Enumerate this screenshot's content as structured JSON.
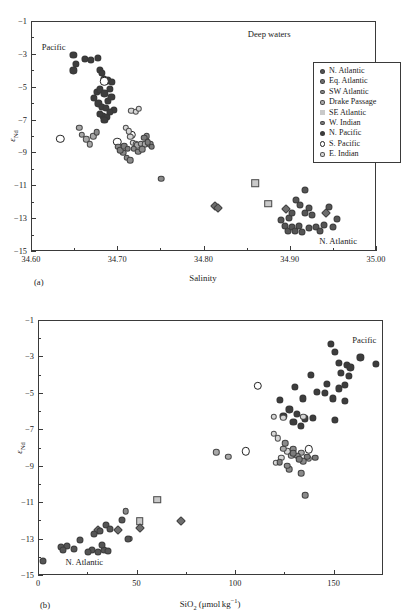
{
  "figure": {
    "suptitle": "",
    "panel_a_label": "(a)",
    "panel_b_label": "(b)"
  },
  "legend": {
    "entries": [
      {
        "label": "N. Atlantic",
        "marker": "circle",
        "color": "#555555",
        "size": 5.2
      },
      {
        "label": "Eq. Atlantic",
        "marker": "circle",
        "color": "#6e6e6e",
        "size": 4.6
      },
      {
        "label": "SW Atlantic",
        "marker": "circle",
        "color": "#8a8a8a",
        "size": 4.6
      },
      {
        "label": "Drake Passage",
        "marker": "circle",
        "color": "#a8a8a8",
        "size": 4.4
      },
      {
        "label": "SE Atlantic",
        "marker": "square",
        "color": "#c9c9c9",
        "size": 5.0
      },
      {
        "label": "W. Indian",
        "marker": "circle",
        "color": "#7c7c7c",
        "size": 4.6
      },
      {
        "label": "N. Pacific",
        "marker": "circle",
        "color": "#3d3d3d",
        "size": 5.4
      },
      {
        "label": "S. Pacific",
        "marker": "open",
        "color": "#ffffff",
        "size": 5.6
      },
      {
        "label": "E. Indian",
        "marker": "circle",
        "color": "#d6d6d6",
        "size": 4.6
      }
    ]
  },
  "chart_data": [
    {
      "panel": "a",
      "type": "scatter",
      "title": "Deep waters",
      "xlabel": "Salinity",
      "ylabel": "eNd",
      "xlim": [
        34.6,
        35.0
      ],
      "ylim": [
        -15,
        -1
      ],
      "xticks": [
        34.6,
        34.7,
        34.8,
        34.9,
        35.0
      ],
      "xticklabels": [
        "34.60",
        "34.70",
        "34.80",
        "34.90",
        "35.00"
      ],
      "yticks": [
        -1,
        -3,
        -5,
        -7,
        -9,
        -11,
        -13,
        -15
      ],
      "yticklabels": [
        "-1",
        "-3",
        "-5",
        "-7",
        "-9",
        "-11",
        "-13",
        "-15"
      ],
      "xminor": [
        34.65,
        34.75,
        34.85,
        34.95
      ],
      "yminor": [
        -2,
        -4,
        -6,
        -8,
        -10,
        -12,
        -14
      ],
      "grid": false,
      "annotations": [
        {
          "text": "Pacific",
          "x": 34.625,
          "y": -2.55
        },
        {
          "text": "Deep waters",
          "x": 34.875,
          "y": -1.7
        },
        {
          "text": "N. Atlantic",
          "x": 34.955,
          "y": -14.35
        }
      ],
      "series": [
        {
          "name": "N. Pacific",
          "marker": "circle",
          "color": "#3d3d3d",
          "size": 7.2,
          "points": [
            [
              34.648,
              -3.0
            ],
            [
              34.651,
              -3.55
            ],
            [
              34.661,
              -3.25
            ],
            [
              34.668,
              -3.3
            ],
            [
              34.676,
              -3.2
            ],
            [
              34.648,
              -3.95
            ],
            [
              34.679,
              -3.9
            ],
            [
              34.681,
              -4.1
            ],
            [
              34.683,
              -4.45
            ],
            [
              34.688,
              -4.55
            ],
            [
              34.693,
              -4.65
            ],
            [
              34.675,
              -5.25
            ],
            [
              34.679,
              -5.1
            ],
            [
              34.684,
              -5.35
            ],
            [
              34.69,
              -5.05
            ],
            [
              34.695,
              -6.35
            ],
            [
              34.677,
              -5.95
            ],
            [
              34.681,
              -6.15
            ],
            [
              34.686,
              -6.25
            ],
            [
              34.69,
              -6.45
            ],
            [
              34.682,
              -6.7
            ],
            [
              34.687,
              -6.8
            ],
            [
              34.679,
              -6.6
            ],
            [
              34.684,
              -6.95
            ],
            [
              34.672,
              -5.6
            ],
            [
              34.688,
              -5.8
            ],
            [
              34.692,
              -5.55
            ]
          ]
        },
        {
          "name": "S. Pacific",
          "marker": "open",
          "color": "#ffffff",
          "size": 8.4,
          "points": [
            [
              34.633,
              -8.1
            ],
            [
              34.699,
              -8.3
            ],
            [
              34.716,
              -7.85
            ],
            [
              34.684,
              -4.6
            ]
          ]
        },
        {
          "name": "E. Indian",
          "marker": "circle",
          "color": "#d6d6d6",
          "size": 6.4,
          "points": [
            [
              34.715,
              -6.4
            ],
            [
              34.72,
              -6.45
            ],
            [
              34.724,
              -6.3
            ],
            [
              34.709,
              -7.45
            ],
            [
              34.712,
              -7.65
            ],
            [
              34.714,
              -8.0
            ],
            [
              34.717,
              -8.35
            ],
            [
              34.72,
              -8.45
            ]
          ]
        },
        {
          "name": "Drake Passage",
          "marker": "circle",
          "color": "#a8a8a8",
          "size": 6.4,
          "points": [
            [
              34.655,
              -7.45
            ],
            [
              34.658,
              -7.85
            ],
            [
              34.663,
              -8.15
            ],
            [
              34.667,
              -8.45
            ],
            [
              34.671,
              -7.95
            ],
            [
              34.722,
              -8.5
            ],
            [
              34.726,
              -8.4
            ],
            [
              34.731,
              -8.45
            ]
          ]
        },
        {
          "name": "SW Atlantic",
          "marker": "circle",
          "color": "#8a8a8a",
          "size": 6.6,
          "points": [
            [
              34.675,
              -7.7
            ],
            [
              34.7,
              -8.6
            ],
            [
              34.706,
              -8.95
            ],
            [
              34.71,
              -9.25
            ],
            [
              34.714,
              -9.4
            ],
            [
              34.718,
              -8.7
            ],
            [
              34.723,
              -8.9
            ],
            [
              34.728,
              -8.75
            ],
            [
              34.733,
              -7.95
            ],
            [
              34.737,
              -8.45
            ],
            [
              34.75,
              -10.55
            ]
          ]
        },
        {
          "name": "W. Indian",
          "marker": "circle",
          "color": "#7c7c7c",
          "size": 6.6,
          "points": [
            [
              34.702,
              -8.8
            ],
            [
              34.707,
              -8.55
            ],
            [
              34.711,
              -8.7
            ],
            [
              34.73,
              -8.05
            ],
            [
              34.734,
              -8.3
            ],
            [
              34.739,
              -8.6
            ]
          ]
        },
        {
          "name": "SE Atlantic",
          "marker": "square",
          "color": "#c9c9c9",
          "size": 7.6,
          "points": [
            [
              34.859,
              -10.8
            ],
            [
              34.874,
              -12.05
            ]
          ]
        },
        {
          "name": "Eq. Atlantic",
          "marker": "diamond",
          "color": "#6e6e6e",
          "size": 7.0,
          "points": [
            [
              34.812,
              -12.2
            ],
            [
              34.816,
              -12.35
            ],
            [
              34.894,
              -12.4
            ],
            [
              34.941,
              -12.65
            ]
          ]
        },
        {
          "name": "N. Atlantic",
          "marker": "circle",
          "color": "#555555",
          "size": 7.0,
          "points": [
            [
              34.889,
              -13.05
            ],
            [
              34.893,
              -13.4
            ],
            [
              34.897,
              -13.7
            ],
            [
              34.901,
              -13.45
            ],
            [
              34.905,
              -13.75
            ],
            [
              34.909,
              -13.4
            ],
            [
              34.913,
              -13.8
            ],
            [
              34.898,
              -12.95
            ],
            [
              34.902,
              -12.65
            ],
            [
              34.906,
              -11.85
            ],
            [
              34.911,
              -12.15
            ],
            [
              34.917,
              -12.6
            ],
            [
              34.921,
              -13.55
            ],
            [
              34.925,
              -12.75
            ],
            [
              34.929,
              -13.45
            ],
            [
              34.934,
              -13.7
            ],
            [
              34.938,
              -13.35
            ],
            [
              34.944,
              -12.25
            ],
            [
              34.949,
              -13.45
            ],
            [
              34.954,
              -13.0
            ],
            [
              34.917,
              -11.25
            ],
            [
              34.921,
              -12.35
            ]
          ]
        }
      ]
    },
    {
      "panel": "b",
      "type": "scatter",
      "title": "",
      "xlabel": "SiO2 (umol kg-1)",
      "ylabel": "eNd",
      "xlim": [
        0,
        175
      ],
      "ylim": [
        -15,
        -1
      ],
      "xticks": [
        0,
        50,
        100,
        150
      ],
      "xticklabels": [
        "0",
        "50",
        "100",
        "150"
      ],
      "yticks": [
        -1,
        -3,
        -5,
        -7,
        -9,
        -11,
        -13,
        -15
      ],
      "yticklabels": [
        "-1",
        "-3",
        "-5",
        "-7",
        "-9",
        "-11",
        "-13",
        "-15"
      ],
      "xminor": [
        25,
        75,
        125
      ],
      "yminor": [
        -2,
        -4,
        -6,
        -8,
        -10,
        -12,
        -14
      ],
      "grid": false,
      "annotations": [
        {
          "text": "Pacific",
          "x": 165,
          "y": -2.05
        },
        {
          "text": "N. Atlantic",
          "x": 23,
          "y": -14.25
        }
      ],
      "series": [
        {
          "name": "N. Pacific",
          "marker": "circle",
          "color": "#3d3d3d",
          "size": 7.2,
          "points": [
            [
              148,
              -2.25
            ],
            [
              150,
              -2.7
            ],
            [
              163,
              -3.0
            ],
            [
              171,
              -3.35
            ],
            [
              152,
              -3.3
            ],
            [
              156,
              -3.4
            ],
            [
              158,
              -3.55
            ],
            [
              153,
              -3.85
            ],
            [
              157,
              -4.0
            ],
            [
              138,
              -3.95
            ],
            [
              146,
              -4.45
            ],
            [
              152,
              -4.7
            ],
            [
              155,
              -4.5
            ],
            [
              130,
              -4.6
            ],
            [
              141,
              -4.9
            ],
            [
              145,
              -4.95
            ],
            [
              149,
              -5.25
            ],
            [
              155,
              -5.4
            ],
            [
              122,
              -5.35
            ],
            [
              134,
              -5.25
            ],
            [
              150,
              -6.45
            ],
            [
              127,
              -5.85
            ],
            [
              131,
              -6.1
            ],
            [
              135,
              -6.35
            ],
            [
              129,
              -6.55
            ],
            [
              133,
              -6.75
            ],
            [
              124,
              -6.2
            ],
            [
              139,
              -6.3
            ]
          ]
        },
        {
          "name": "S. Pacific",
          "marker": "open",
          "color": "#ffffff",
          "size": 8.4,
          "points": [
            [
              111,
              -4.55
            ],
            [
              105,
              -8.15
            ],
            [
              137,
              -8.05
            ]
          ]
        },
        {
          "name": "E. Indian",
          "marker": "circle",
          "color": "#d6d6d6",
          "size": 6.4,
          "points": [
            [
              119,
              -6.25
            ],
            [
              124,
              -6.3
            ],
            [
              134,
              -6.25
            ],
            [
              119,
              -7.2
            ],
            [
              121,
              -7.45
            ],
            [
              120,
              -8.8
            ],
            [
              123,
              -8.5
            ],
            [
              126,
              -8.15
            ]
          ]
        },
        {
          "name": "Drake Passage",
          "marker": "circle",
          "color": "#a8a8a8",
          "size": 6.4,
          "points": [
            [
              90,
              -8.2
            ],
            [
              96,
              -8.45
            ],
            [
              128,
              -8.4
            ],
            [
              133,
              -8.25
            ],
            [
              137,
              -8.55
            ],
            [
              124,
              -8.0
            ]
          ]
        },
        {
          "name": "SW Atlantic",
          "marker": "circle",
          "color": "#8a8a8a",
          "size": 6.6,
          "points": [
            [
              125,
              -7.7
            ],
            [
              129,
              -8.05
            ],
            [
              131,
              -8.4
            ],
            [
              134,
              -8.7
            ],
            [
              127,
              -9.15
            ],
            [
              133,
              -9.35
            ],
            [
              135,
              -10.55
            ],
            [
              126,
              -8.95
            ],
            [
              44,
              -11.45
            ],
            [
              46,
              -12.95
            ]
          ]
        },
        {
          "name": "W. Indian",
          "marker": "circle",
          "color": "#7c7c7c",
          "size": 6.6,
          "points": [
            [
              129,
              -8.25
            ],
            [
              132,
              -8.6
            ],
            [
              136,
              -8.45
            ],
            [
              140,
              -8.5
            ],
            [
              122,
              -8.75
            ]
          ]
        },
        {
          "name": "SE Atlantic",
          "marker": "square",
          "color": "#c9c9c9",
          "size": 7.6,
          "points": [
            [
              60,
              -10.8
            ],
            [
              51,
              -12.0
            ]
          ]
        },
        {
          "name": "Eq. Atlantic",
          "marker": "diamond",
          "color": "#6e6e6e",
          "size": 7.0,
          "points": [
            [
              30,
              -12.5
            ],
            [
              40,
              -12.45
            ],
            [
              72,
              -12.0
            ],
            [
              51,
              -12.35
            ]
          ]
        },
        {
          "name": "N. Atlantic",
          "marker": "circle",
          "color": "#555555",
          "size": 7.0,
          "points": [
            [
              2,
              -14.15
            ],
            [
              11,
              -13.4
            ],
            [
              14,
              -13.35
            ],
            [
              21,
              -13.0
            ],
            [
              27,
              -13.55
            ],
            [
              30,
              -13.7
            ],
            [
              33,
              -13.55
            ],
            [
              35,
              -13.6
            ],
            [
              31,
              -12.55
            ],
            [
              34,
              -12.2
            ],
            [
              42,
              -11.95
            ],
            [
              28,
              -12.7
            ],
            [
              36,
              -12.4
            ],
            [
              25,
              -13.7
            ],
            [
              18,
              -13.5
            ],
            [
              32,
              -13.3
            ],
            [
              45,
              -12.95
            ],
            [
              12,
              -13.55
            ]
          ]
        }
      ]
    }
  ]
}
